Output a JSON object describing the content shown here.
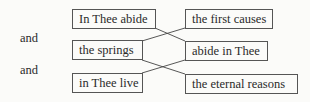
{
  "left_labels": [
    "and",
    "and"
  ],
  "left_boxes": [
    "In Thee abide",
    "the springs",
    "in Thee live"
  ],
  "right_boxes": [
    "the first causes",
    "abide in Thee",
    "the eternal reasons"
  ]
}
